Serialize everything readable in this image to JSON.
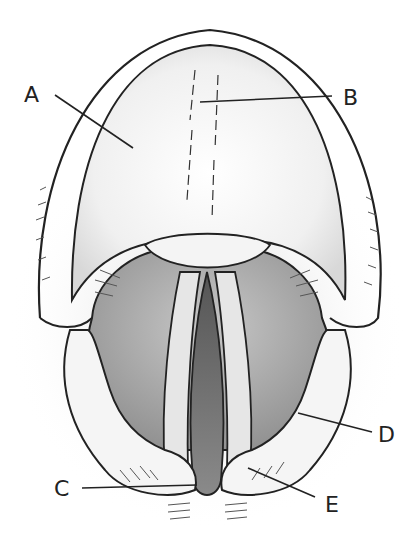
{
  "figure": {
    "labels": [
      {
        "id": "A",
        "text": "A",
        "x": 24,
        "y": 84
      },
      {
        "id": "B",
        "text": "B",
        "x": 343,
        "y": 87
      },
      {
        "id": "C",
        "text": "C",
        "x": 54,
        "y": 481
      },
      {
        "id": "D",
        "text": "D",
        "x": 378,
        "y": 426
      },
      {
        "id": "E",
        "text": "E",
        "x": 325,
        "y": 497
      }
    ]
  }
}
